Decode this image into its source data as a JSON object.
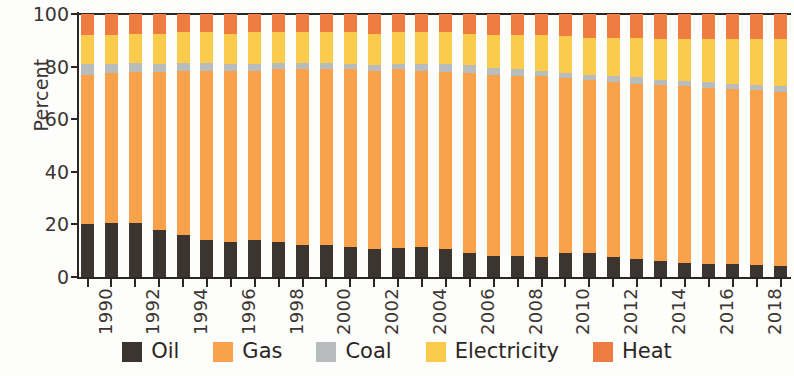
{
  "chart_data": {
    "type": "bar",
    "stacked": true,
    "stack_total": 100,
    "title": "",
    "subtitle": "",
    "xlabel": "",
    "ylabel": "Percent",
    "ylim": [
      0,
      100
    ],
    "yticks": [
      0,
      20,
      40,
      60,
      80,
      100
    ],
    "grid": false,
    "legend_position": "bottom",
    "x": [
      1990,
      1991,
      1992,
      1993,
      1994,
      1995,
      1996,
      1997,
      1998,
      1999,
      2000,
      2001,
      2002,
      2003,
      2004,
      2005,
      2006,
      2007,
      2008,
      2009,
      2010,
      2011,
      2012,
      2013,
      2014,
      2015,
      2016,
      2017,
      2018,
      2019
    ],
    "categories": [
      "1990",
      "1991",
      "1992",
      "1993",
      "1994",
      "1995",
      "1996",
      "1997",
      "1998",
      "1999",
      "2000",
      "2001",
      "2002",
      "2003",
      "2004",
      "2005",
      "2006",
      "2007",
      "2008",
      "2009",
      "2010",
      "2011",
      "2012",
      "2013",
      "2014",
      "2015",
      "2016",
      "2017",
      "2018",
      "2019"
    ],
    "xtick_labels": [
      "1990",
      "1992",
      "1994",
      "1996",
      "1998",
      "2000",
      "2002",
      "2004",
      "2006",
      "2008",
      "2010",
      "2012",
      "2014",
      "2016",
      "2018"
    ],
    "xtick_label_rotation": 90,
    "series": [
      {
        "name": "Oil",
        "color": "#3b342f",
        "values": [
          20,
          20.5,
          20.5,
          18,
          16,
          14,
          13.5,
          14,
          13.5,
          12,
          12,
          11.5,
          10.5,
          11,
          11.5,
          10.5,
          9,
          8,
          8,
          7.5,
          9,
          9,
          7.5,
          7,
          6,
          5.5,
          5,
          5,
          4.5,
          4
        ]
      },
      {
        "name": "Gas",
        "color": "#f9a24b",
        "values": [
          57,
          57,
          57.5,
          60,
          62.5,
          64.5,
          65,
          64.5,
          65.5,
          67,
          67,
          67.5,
          68,
          68,
          67,
          67.5,
          68.5,
          69,
          68.5,
          69,
          66.5,
          66,
          66.5,
          66.5,
          67,
          67,
          67,
          66.5,
          66.5,
          66.5
        ]
      },
      {
        "name": "Coal",
        "color": "#b9bcbd",
        "values": [
          4,
          3.5,
          3.5,
          3,
          3,
          3,
          2.5,
          2.5,
          2.5,
          2.5,
          2.5,
          2,
          2,
          2,
          2.5,
          3,
          3,
          2.5,
          2.5,
          2,
          2,
          2,
          2.5,
          2.5,
          2,
          2,
          2,
          2,
          2,
          2
        ]
      },
      {
        "name": "Electricity",
        "color": "#fbcb4c",
        "values": [
          11,
          11,
          11,
          11.5,
          11.5,
          11.5,
          11.5,
          12,
          11.5,
          11.5,
          11.5,
          12,
          12,
          12,
          12,
          12,
          12,
          12.5,
          13,
          13.5,
          14,
          14,
          14.5,
          15,
          15.5,
          16,
          16.5,
          17,
          17.5,
          18
        ]
      },
      {
        "name": "Heat",
        "color": "#ef7d42",
        "values": [
          8,
          8,
          7.5,
          7.5,
          7,
          7,
          7.5,
          7,
          7,
          7,
          7,
          7,
          7.5,
          7,
          7,
          7,
          7.5,
          8,
          8,
          8,
          8.5,
          9,
          9,
          9,
          9.5,
          9.5,
          9.5,
          9.5,
          9.5,
          9.5
        ]
      }
    ],
    "legend": [
      {
        "label": "Oil",
        "color": "#3b342f"
      },
      {
        "label": "Gas",
        "color": "#f9a24b"
      },
      {
        "label": "Coal",
        "color": "#b9bcbd"
      },
      {
        "label": "Electricity",
        "color": "#fbcb4c"
      },
      {
        "label": "Heat",
        "color": "#ef7d42"
      }
    ]
  }
}
